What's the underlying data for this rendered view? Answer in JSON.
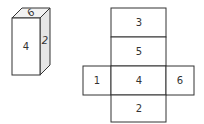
{
  "cube": {
    "front_label": "4",
    "top_label": "6",
    "side_label": "2"
  },
  "net": {
    "faces": [
      {
        "position": "top",
        "label": "3"
      },
      {
        "position": "upper-middle",
        "label": "5"
      },
      {
        "position": "left",
        "label": "1"
      },
      {
        "position": "center",
        "label": "4"
      },
      {
        "position": "right",
        "label": "6"
      },
      {
        "position": "bottom",
        "label": "2"
      }
    ]
  },
  "colors": {
    "stroke": "#333333",
    "side_fill": "#e6e6e6",
    "top_fill": "#f2f2f2",
    "face_fill": "#ffffff"
  }
}
